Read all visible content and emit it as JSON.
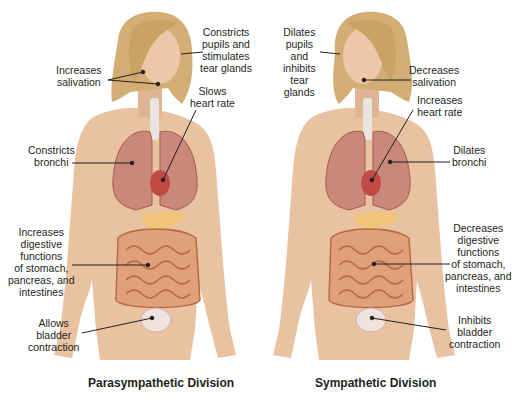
{
  "colors": {
    "skin": "#e9c2a2",
    "skin_shadow": "#d4a183",
    "hair": "#d2ae74",
    "hair_dark": "#a9834c",
    "lung": "#c98878",
    "lung_dark": "#a55a4c",
    "heart": "#c24a45",
    "trachea": "#e8e4de",
    "intestine": "#e0a07a",
    "intestine_dark": "#b86a46",
    "pancreas": "#f0c57a",
    "bladder": "#efe2df",
    "text": "#231f20",
    "leader_line": "#231f20"
  },
  "parasympathetic": {
    "title": "Parasympathetic Division",
    "labels": {
      "eyes": [
        "Constricts",
        "pupils and",
        "stimulates",
        "tear glands"
      ],
      "salivation": [
        "Increases",
        "salivation"
      ],
      "heart": [
        "Slows",
        "heart rate"
      ],
      "bronchi": [
        "Constricts",
        "bronchi"
      ],
      "digestion": [
        "Increases",
        "digestive",
        "functions",
        "of stomach,",
        "pancreas, and",
        "intestines"
      ],
      "bladder": [
        "Allows",
        "bladder",
        "contraction"
      ]
    }
  },
  "sympathetic": {
    "title": "Sympathetic Division",
    "labels": {
      "eyes": [
        "Dilates",
        "pupils",
        "and",
        "inhibits",
        "tear",
        "glands"
      ],
      "salivation": [
        "Decreases",
        "salivation"
      ],
      "heart": [
        "Increases",
        "heart rate"
      ],
      "bronchi": [
        "Dilates",
        "bronchi"
      ],
      "digestion": [
        "Decreases",
        "digestive",
        "functions",
        "of stomach,",
        "pancreas, and",
        "intestines"
      ],
      "bladder": [
        "Inhibits",
        "bladder",
        "contraction"
      ]
    }
  }
}
